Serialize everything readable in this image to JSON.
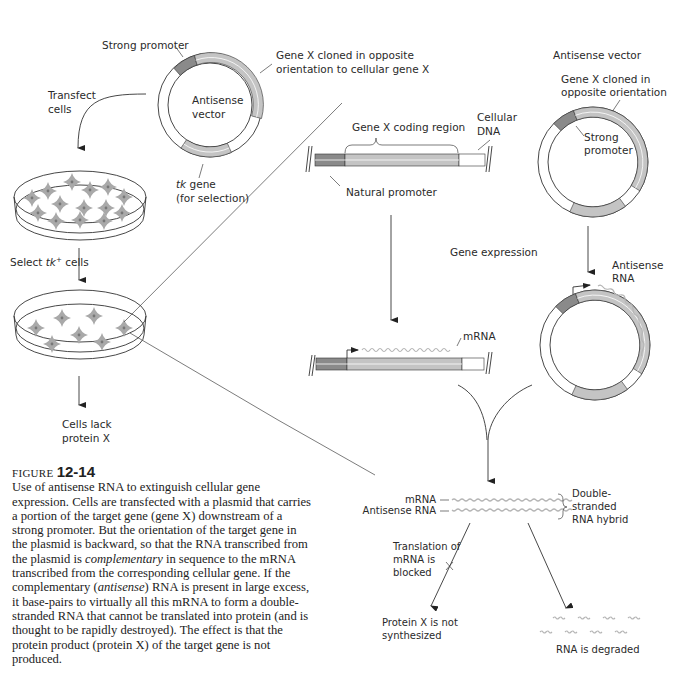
{
  "left_panel": {
    "strong_promoter": "Strong promoter",
    "gene_x_cloned_line1": "Gene X cloned in opposite",
    "gene_x_cloned_line2": "orientation to cellular gene X",
    "vector_line1": "Antisense",
    "vector_line2": "vector",
    "transfect_line1": "Transfect",
    "transfect_line2": "cells",
    "tk_gene_italic": "tk",
    "tk_gene_rest": " gene",
    "tk_gene_line2": "(for selection)",
    "select_prefix": "Select ",
    "select_italic": "tk",
    "select_sup": "+",
    "select_suffix": " cells",
    "cells_lack_line1": "Cells lack",
    "cells_lack_line2": "protein X"
  },
  "middle_panel": {
    "coding_region": "Gene X coding region",
    "cellular_dna_line1": "Cellular",
    "cellular_dna_line2": "DNA",
    "natural_promoter": "Natural  promoter",
    "gene_expression": "Gene expression",
    "mrna": "mRNA"
  },
  "right_panel": {
    "title": "Antisense vector",
    "cloned_line1": "Gene X cloned in",
    "cloned_line2": "opposite orientation",
    "strong_line1": "Strong",
    "strong_line2": "promoter",
    "antisense_rna_line1": "Antisense",
    "antisense_rna_line2": "RNA"
  },
  "bottom_panel": {
    "mrna_label": "mRNA",
    "antisense_label": "Antisense RNA",
    "hybrid_line1": "Double-",
    "hybrid_line2": "stranded",
    "hybrid_line3": "RNA hybrid",
    "translation_line1": "Translation of",
    "translation_line2": "mRNA is",
    "translation_line3": "blocked",
    "protein_line1": "Protein X is not",
    "protein_line2": "synthesized",
    "degraded": "RNA is degraded"
  },
  "caption": {
    "figure_word": "FIGURE",
    "figure_number": "12-14",
    "part1": "Use of antisense RNA to extinguish cellular gene expression. Cells are transfected with a plasmid that carries a portion of the target gene (gene X) downstream of a strong promoter. But the orientation of the target gene in the plasmid is backward, so that the RNA transcribed from the plasmid is ",
    "italic1": "complementary",
    "part2": " in sequence to the mRNA transcribed from the corresponding cellular gene. If the complementary (",
    "italic2": "antisense",
    "part3": ") RNA is present in large excess, it base-pairs to virtually all this mRNA to form a double-stranded RNA that cannot be translated into protein (and is thought to be rapidly destroyed). The effect is that the protein product (protein X) of the target gene is not produced."
  },
  "colors": {
    "promoter_dark": "#8a8a8a",
    "gene_light": "#c4c4c4",
    "cell_gray": "#a9a9a9",
    "rna_wavy": "#b5b5b5",
    "line": "#333333"
  }
}
